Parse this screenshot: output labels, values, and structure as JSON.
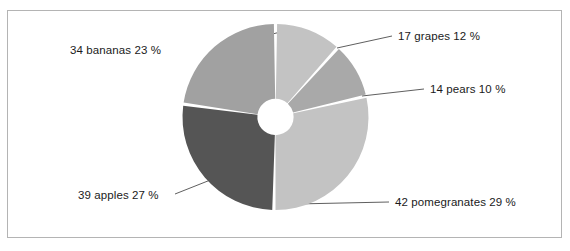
{
  "frame": {
    "border_color": "#b4b4b4",
    "background": "#ffffff"
  },
  "chart_data": {
    "type": "pie",
    "variant": "donut",
    "title": "",
    "subtitle": "",
    "xlabel": "",
    "ylabel": "",
    "legend_position": "none",
    "grid": false,
    "units": "count",
    "total_count": 146,
    "start_angle_deg": 0,
    "direction": "clockwise",
    "inner_radius_ratio": 0.195,
    "categories": [
      "grapes",
      "pears",
      "pomegranates",
      "apples",
      "bananas"
    ],
    "values": [
      17,
      14,
      42,
      39,
      34
    ],
    "percentages": [
      12,
      10,
      29,
      27,
      23
    ],
    "colors": [
      "#c3c3c3",
      "#a9a9a9",
      "#c3c3c3",
      "#555555",
      "#a1a1a1"
    ],
    "labels": [
      "17 grapes 12 %",
      "14 pears 10 %",
      "42 pomegranates 29 %",
      "39 apples 27 %",
      "34 bananas 23 %"
    ],
    "slices": [
      {
        "name": "grapes",
        "count": 17,
        "percent": 12,
        "label": "17 grapes 12 %",
        "color": "#c3c3c3",
        "start_deg": 0,
        "end_deg": 42
      },
      {
        "name": "pears",
        "count": 14,
        "percent": 10,
        "label": "14 pears 10 %",
        "color": "#a9a9a9",
        "start_deg": 42,
        "end_deg": 77
      },
      {
        "name": "pomegranates",
        "count": 42,
        "percent": 29,
        "label": "42 pomegranates 29 %",
        "color": "#c3c3c3",
        "start_deg": 77,
        "end_deg": 181
      },
      {
        "name": "apples",
        "count": 39,
        "percent": 27,
        "label": "39 apples 27 %",
        "color": "#555555",
        "start_deg": 181,
        "end_deg": 278
      },
      {
        "name": "bananas",
        "count": 34,
        "percent": 23,
        "label": "34 bananas 23 %",
        "color": "#a1a1a1",
        "start_deg": 278,
        "end_deg": 360
      }
    ]
  }
}
